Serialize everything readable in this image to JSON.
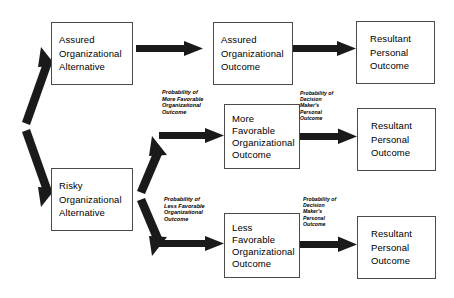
{
  "diagram": {
    "boxes": [
      {
        "id": "assured-organizational-alternative",
        "lines": [
          "Assured",
          "Organizational",
          "Alternative"
        ]
      },
      {
        "id": "assured-organizational-outcome",
        "lines": [
          "Assured",
          "Organizational",
          "Outcome"
        ]
      },
      {
        "id": "resultant-personal-outcome-top",
        "lines": [
          "Resultant",
          "Personal",
          "Outcome"
        ]
      },
      {
        "id": "risky-organizational-alternative",
        "lines": [
          "Risky",
          "Organizational",
          "Alternative"
        ]
      },
      {
        "id": "more-favorable-organizational-outcome",
        "lines": [
          "More",
          "Favorable",
          "Organizational",
          "Outcome"
        ]
      },
      {
        "id": "resultant-personal-outcome-middle",
        "lines": [
          "Resultant",
          "Personal",
          "Outcome"
        ]
      },
      {
        "id": "less-favorable-organizational-outcome",
        "lines": [
          "Less",
          "Favorable",
          "Organizational",
          "Outcome"
        ]
      },
      {
        "id": "resultant-personal-outcome-bottom",
        "lines": [
          "Resultant",
          "Personal",
          "Outcome"
        ]
      }
    ],
    "labels": [
      {
        "id": "probability-more-favorable-organizational-outcome",
        "lines": [
          "Probability of",
          "More Favorable",
          "Organizational",
          "Outcome"
        ]
      },
      {
        "id": "probability-decision-makers-personal-outcome-middle",
        "lines": [
          "Probability of",
          "Decision",
          "Maker's",
          "Personal",
          "Outcome"
        ]
      },
      {
        "id": "probability-less-favorable-organizational-outcome",
        "lines": [
          "Probability of",
          "Less Favorable",
          "Organizational",
          "Outcome"
        ]
      },
      {
        "id": "probability-decision-makers-personal-outcome-bottom",
        "lines": [
          "Probability of",
          "Decision",
          "Maker's",
          "Personal",
          "Outcome"
        ]
      }
    ],
    "colors": {
      "arrow": "#1a1a1a",
      "box_border": "#4a4a4a",
      "text": "#000000",
      "background": "#ffffff"
    }
  }
}
